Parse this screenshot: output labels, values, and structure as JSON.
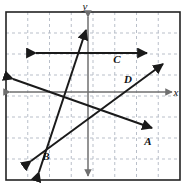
{
  "figure": {
    "type": "coordinate-grid-diagram",
    "width": 186,
    "height": 189,
    "background_color": "#ffffff",
    "frame": {
      "stroke_color": "#222222",
      "x": 6,
      "y": 12,
      "width": 174,
      "height": 168
    },
    "grid": {
      "visible": true,
      "style": "dashed",
      "color": "#b9bfc9",
      "cell_size": 21.5,
      "columns": 8,
      "rows": 8
    },
    "axes": {
      "color": "#6f6f6f",
      "origin_x": 88,
      "origin_y": 92,
      "x_axis": {
        "label": "x",
        "label_x": 176,
        "label_y": 96,
        "from_x": 10,
        "to_x": 172,
        "y": 92,
        "arrows": "both"
      },
      "y_axis": {
        "label": "y",
        "label_x": 85,
        "label_y": 10,
        "from_y": 17,
        "to_y": 176,
        "x": 88,
        "arrows": "both"
      }
    },
    "lines": [
      {
        "id": "A",
        "label": "A",
        "label_x": 148,
        "label_y": 145,
        "color": "#1a1a1a",
        "arrows": "both",
        "x1": 13,
        "y1": 79,
        "x2": 152,
        "y2": 128,
        "description": "line with negative slope crossing from upper-left to lower-right"
      },
      {
        "id": "B",
        "label": "B",
        "label_x": 46,
        "label_y": 160,
        "color": "#1a1a1a",
        "arrows": "both",
        "x1": 39,
        "y1": 172,
        "x2": 86,
        "y2": 30,
        "description": "steep line with large positive slope rising from lower-left to top"
      },
      {
        "id": "C",
        "label": "C",
        "label_x": 117,
        "label_y": 63,
        "color": "#1a1a1a",
        "arrows": "both",
        "x1": 36,
        "y1": 53,
        "x2": 147,
        "y2": 53,
        "description": "horizontal line with zero slope above the x-axis"
      },
      {
        "id": "D",
        "label": "D",
        "label_x": 128,
        "label_y": 83,
        "color": "#1a1a1a",
        "arrows": "both",
        "x1": 31,
        "y1": 161,
        "x2": 163,
        "y2": 64,
        "description": "line with moderate positive slope rising from lower-left to upper-right"
      }
    ]
  }
}
